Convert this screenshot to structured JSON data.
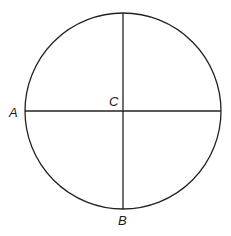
{
  "diagram": {
    "type": "circle-with-perpendicular-diameters",
    "circle": {
      "cx": 123,
      "cy": 111,
      "r": 98,
      "stroke": "#222222"
    },
    "lines": [
      {
        "name": "horizontal-diameter",
        "x1": 25,
        "y1": 111,
        "x2": 221,
        "y2": 111
      },
      {
        "name": "vertical-radius",
        "x1": 123,
        "y1": 13,
        "x2": 123,
        "y2": 209
      }
    ],
    "labels": {
      "A": "A",
      "B": "B",
      "C": "C"
    }
  }
}
